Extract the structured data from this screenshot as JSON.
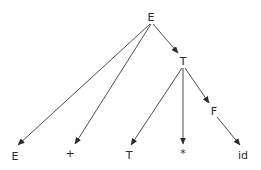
{
  "diagram": {
    "type": "parse-tree",
    "nodes": [
      {
        "id": "n0",
        "label": "E",
        "x": 151,
        "y": 17
      },
      {
        "id": "n1",
        "label": "T",
        "x": 183,
        "y": 61
      },
      {
        "id": "n2",
        "label": "F",
        "x": 214,
        "y": 111
      },
      {
        "id": "n3",
        "label": "E",
        "x": 15,
        "y": 156
      },
      {
        "id": "n4",
        "label": "+",
        "x": 70,
        "y": 153
      },
      {
        "id": "n5",
        "label": "T",
        "x": 129,
        "y": 155
      },
      {
        "id": "n6",
        "label": "*",
        "x": 183,
        "y": 153
      },
      {
        "id": "n7",
        "label": "id",
        "x": 243,
        "y": 155
      }
    ],
    "edges": [
      {
        "from": "n0",
        "to": "n3",
        "x1": 150,
        "y1": 24,
        "x2": 18,
        "y2": 145
      },
      {
        "from": "n0",
        "to": "n4",
        "x1": 151,
        "y1": 24,
        "x2": 75,
        "y2": 144
      },
      {
        "from": "n0",
        "to": "n1",
        "x1": 153,
        "y1": 24,
        "x2": 178,
        "y2": 53
      },
      {
        "from": "n1",
        "to": "n5",
        "x1": 182,
        "y1": 68,
        "x2": 131,
        "y2": 145
      },
      {
        "from": "n1",
        "to": "n6",
        "x1": 183,
        "y1": 68,
        "x2": 183,
        "y2": 144
      },
      {
        "from": "n1",
        "to": "n2",
        "x1": 185,
        "y1": 68,
        "x2": 209,
        "y2": 103
      },
      {
        "from": "n2",
        "to": "n7",
        "x1": 217,
        "y1": 117,
        "x2": 240,
        "y2": 145
      }
    ]
  }
}
